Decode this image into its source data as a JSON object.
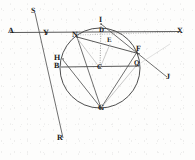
{
  "figure": {
    "type": "geometry-diagram",
    "canvas": {
      "width": 195,
      "height": 160
    },
    "circle": {
      "cx": 100,
      "cy": 68,
      "r": 40
    },
    "points": [
      {
        "id": "A",
        "label": "A",
        "x": 10,
        "y": 32,
        "label_x": 8,
        "label_y": 28,
        "kind": "ray-endpoint"
      },
      {
        "id": "S",
        "label": "S",
        "x": 33,
        "y": 11,
        "label_x": 31,
        "label_y": 8,
        "kind": "ray-endpoint"
      },
      {
        "id": "X",
        "label": "X",
        "x": 180,
        "y": 32,
        "label_x": 178,
        "label_y": 28,
        "kind": "ray-endpoint"
      },
      {
        "id": "J",
        "label": "J",
        "x": 168,
        "y": 78,
        "label_x": 166,
        "label_y": 74,
        "kind": "ray-endpoint"
      },
      {
        "id": "R",
        "label": "R",
        "x": 62,
        "y": 140,
        "label_x": 58,
        "label_y": 136,
        "kind": "ray-endpoint"
      },
      {
        "id": "I",
        "label": "I",
        "x": 101,
        "y": 24,
        "label_x": 99,
        "label_y": 19,
        "kind": "on-circle"
      },
      {
        "id": "Y",
        "label": "Y",
        "x": 47,
        "y": 33,
        "label_x": 44,
        "label_y": 30,
        "kind": "intersection"
      },
      {
        "id": "N",
        "label": "N",
        "x": 77,
        "y": 37,
        "label_x": 74,
        "label_y": 33,
        "kind": "on-circle"
      },
      {
        "id": "D",
        "label": "D",
        "x": 101,
        "y": 33,
        "label_x": 99,
        "label_y": 29,
        "kind": "on-chord"
      },
      {
        "id": "E",
        "label": "E",
        "x": 110,
        "y": 43,
        "label_x": 108,
        "label_y": 39,
        "kind": "on-chord"
      },
      {
        "id": "F",
        "label": "F",
        "x": 137,
        "y": 52,
        "label_x": 136,
        "label_y": 48,
        "kind": "on-circle"
      },
      {
        "id": "H",
        "label": "H",
        "x": 63,
        "y": 59,
        "label_x": 57,
        "label_y": 56,
        "kind": "on-circle"
      },
      {
        "id": "B",
        "label": "B",
        "x": 61,
        "y": 67,
        "label_x": 56,
        "label_y": 64,
        "kind": "chord-endpoint"
      },
      {
        "id": "C",
        "label": "C",
        "x": 100,
        "y": 68,
        "label_x": 98,
        "label_y": 65,
        "kind": "center"
      },
      {
        "id": "Q",
        "label": "Q",
        "x": 136,
        "y": 66,
        "label_x": 134,
        "label_y": 62,
        "kind": "on-circle"
      },
      {
        "id": "G",
        "label": "G",
        "x": 101,
        "y": 108,
        "label_x": 99,
        "label_y": 105,
        "kind": "on-circle"
      }
    ],
    "segments": [
      {
        "name": "line-A-X",
        "from": "A",
        "to": "X",
        "style": "solid"
      },
      {
        "name": "line-S-R",
        "from": "S",
        "to": "R",
        "style": "solid"
      },
      {
        "name": "line-I-J",
        "from": "I",
        "to": "J",
        "style": "solid"
      },
      {
        "name": "chord-N-F",
        "from": "N",
        "to": "F",
        "style": "solid"
      },
      {
        "name": "chord-B-Q",
        "from": "B",
        "to": "Q",
        "style": "solid"
      },
      {
        "name": "chord-N-G",
        "from": "N",
        "to": "G",
        "style": "solid"
      },
      {
        "name": "chord-H-G",
        "from": "H",
        "to": "G",
        "style": "solid"
      },
      {
        "name": "chord-G-F",
        "from": "G",
        "to": "F",
        "style": "solid"
      },
      {
        "name": "radius-C-I",
        "from": "C",
        "to": "I",
        "style": "dotted"
      },
      {
        "name": "radius-C-N",
        "from": "C",
        "to": "N",
        "style": "light"
      },
      {
        "name": "radius-C-E",
        "from": "C",
        "to": "E",
        "style": "light"
      },
      {
        "name": "chord-G-Q",
        "from": "G",
        "to": "Q",
        "style": "light"
      },
      {
        "name": "dotted-N-X",
        "from": "N",
        "to": "X",
        "style": "dotted"
      }
    ],
    "colors": {
      "ink": "#3a3a3a",
      "ink_dark": "#222222",
      "ink_light": "#9a9a9a",
      "paper": "#fdfdfc"
    }
  }
}
